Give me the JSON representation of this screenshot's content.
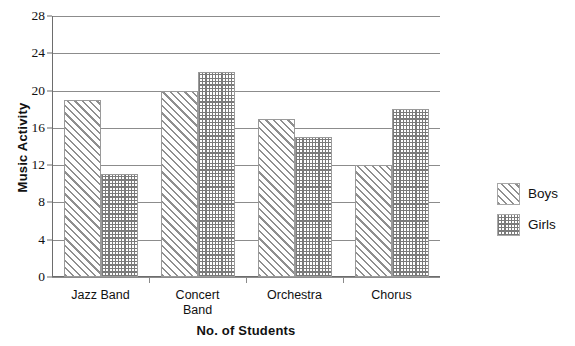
{
  "chart_data": {
    "type": "bar",
    "title": "",
    "subtitle": "",
    "xlabel": "No. of Students",
    "ylabel": "Music Activity",
    "categories": [
      "Jazz Band",
      "Concert\nBand",
      "Orchestra",
      "Chorus"
    ],
    "series": [
      {
        "name": "Boys",
        "values": [
          19,
          20,
          17,
          12
        ],
        "pattern": "diagonal-hatch"
      },
      {
        "name": "Girls",
        "values": [
          11,
          22,
          15,
          18
        ],
        "pattern": "dotted-grid"
      }
    ],
    "ylim": [
      0,
      28
    ],
    "ytick_values": [
      0,
      4,
      8,
      12,
      16,
      20,
      24,
      28
    ],
    "ytick_labels": [
      "0",
      "4",
      "8",
      "12",
      "16",
      "20",
      "24",
      "28"
    ],
    "grid": true,
    "grid_axis": "y",
    "legend_position": "right",
    "legend_entries": [
      "Boys",
      "Girls"
    ],
    "bar_colors": {
      "boys_line": "#8f8f8f",
      "girls_line": "#7a7a7a",
      "gridline": "#8c8c8c",
      "axis": "#6d6d6d",
      "background": "#ffffff",
      "text": "#111111"
    }
  }
}
